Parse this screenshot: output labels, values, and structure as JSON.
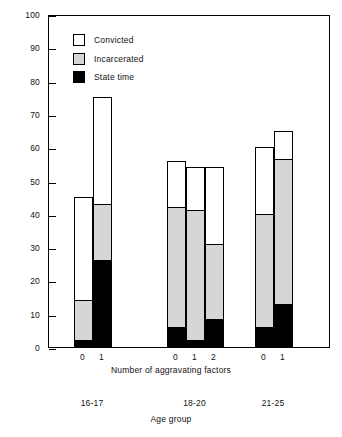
{
  "chart_data": {
    "type": "bar",
    "title": "",
    "subtitle": "",
    "ylabel": "Percent of arrests",
    "xlabel": "Number of aggravating factors",
    "secondary_xlabel": "Age group",
    "ylim": [
      0,
      100
    ],
    "y_ticks": [
      0,
      10,
      20,
      30,
      40,
      50,
      60,
      70,
      80,
      90,
      100
    ],
    "grid": false,
    "legend_position": "top-left",
    "stacked": true,
    "legend": [
      {
        "key": "convicted",
        "label": "Convicted",
        "color": "#ffffff"
      },
      {
        "key": "incarcerated",
        "label": "Incarcerated",
        "color": "#d6d6d6"
      },
      {
        "key": "state_time",
        "label": "State time",
        "color": "#000000"
      }
    ],
    "groups": [
      {
        "age_group": "16-17",
        "bars": [
          {
            "factors": "0",
            "convicted": 45,
            "incarcerated": 14,
            "state_time": 2
          },
          {
            "factors": "1",
            "convicted": 75,
            "incarcerated": 43,
            "state_time": 26
          }
        ]
      },
      {
        "age_group": "18-20",
        "bars": [
          {
            "factors": "0",
            "convicted": 56,
            "incarcerated": 42,
            "state_time": 6
          },
          {
            "factors": "1",
            "convicted": 54,
            "incarcerated": 41,
            "state_time": 2
          },
          {
            "factors": "2",
            "convicted": 54,
            "incarcerated": 31,
            "state_time": 8.5
          }
        ]
      },
      {
        "age_group": "21-25",
        "bars": [
          {
            "factors": "0",
            "convicted": 60,
            "incarcerated": 40,
            "state_time": 6
          },
          {
            "factors": "1",
            "convicted": 65,
            "incarcerated": 56.5,
            "state_time": 13
          }
        ]
      }
    ]
  },
  "axis": {
    "y_tick_labels": [
      "100",
      "90",
      "80",
      "70",
      "60",
      "50",
      "40",
      "30",
      "20",
      "10",
      "0"
    ],
    "y_title": "Percent of arrests",
    "x_title": "Number of aggravating factors",
    "group_title": "Age group"
  }
}
